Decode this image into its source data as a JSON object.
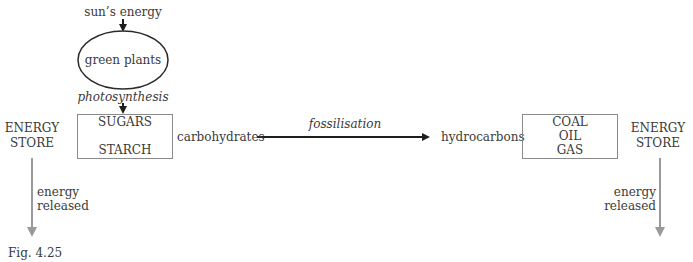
{
  "figure_label": "Fig. 4.25",
  "nodes": {
    "source": "sun’s energy",
    "producer": "green plants",
    "process_1": "photosynthesis",
    "left_box": {
      "line1": "SUGARS",
      "line2": "STARCH"
    },
    "left_group": "carbohydrates",
    "process_2": "fossilisation",
    "right_group": "hydrocarbons",
    "right_box": {
      "line1": "COAL",
      "line2": "OIL",
      "line3": "GAS"
    }
  },
  "left_store": {
    "line1": "ENERGY",
    "line2": "STORE",
    "release_line1": "energy",
    "release_line2": "released"
  },
  "right_store": {
    "line1": "ENERGY",
    "line2": "STORE",
    "release_line1": "energy",
    "release_line2": "released"
  },
  "colors": {
    "text": "#3a3a3a",
    "main_arrow": "#1e1e1e",
    "release_arrow": "#9a9a9a",
    "box_border": "#8a8a8a"
  }
}
